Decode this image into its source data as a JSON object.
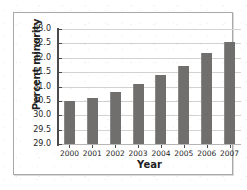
{
  "chart_data": {
    "type": "bar",
    "title": "",
    "xlabel": "Year",
    "ylabel": "Percent minority",
    "categories": [
      "2000",
      "2001",
      "2002",
      "2003",
      "2004",
      "2005",
      "2006",
      "2007"
    ],
    "values": [
      30.5,
      30.6,
      30.8,
      31.1,
      31.4,
      31.7,
      32.15,
      32.55
    ],
    "ylim": [
      29.0,
      33.0
    ],
    "ytick_labels": [
      "29.0",
      "29.5",
      "30.0",
      "30.5",
      "31.0",
      "31.5",
      "32.0",
      "32.5",
      "33.0"
    ],
    "ytick_values": [
      29.0,
      29.5,
      30.0,
      30.5,
      31.0,
      31.5,
      32.0,
      32.5,
      33.0
    ],
    "ytick_step": 0.5,
    "grid": true,
    "legend": "none",
    "bar_color": "#706f6d",
    "gridline_color": "#d2d2d2",
    "axis_color": "#4a4a4a",
    "frame_color": "#a8a8a8",
    "background_color": "#ffffff"
  }
}
